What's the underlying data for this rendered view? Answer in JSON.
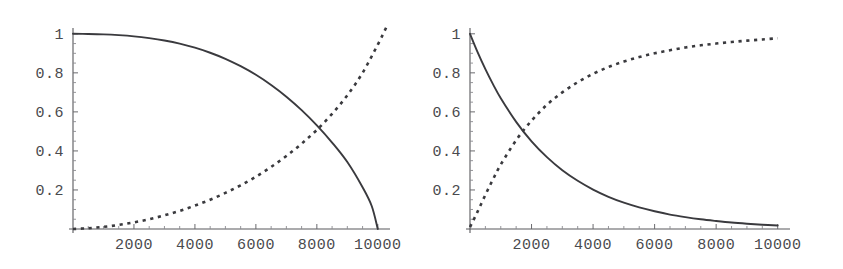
{
  "figure": {
    "background_color": "#ffffff",
    "ink_color": "#3a3a3e",
    "axis_color": "#58585c",
    "panel_count": 2
  },
  "chart_data": [
    {
      "type": "line",
      "title": "",
      "subtitle": "",
      "xlabel": "",
      "ylabel": "",
      "panel": "left",
      "xlim": [
        0,
        10400
      ],
      "ylim": [
        0,
        1.04
      ],
      "grid": false,
      "legend": "none",
      "xticks": [
        2000,
        4000,
        6000,
        8000,
        10000
      ],
      "xtick_labels": [
        "2000",
        "4000",
        "6000",
        "8000",
        "10000"
      ],
      "yticks": [
        0.2,
        0.4,
        0.6,
        0.8,
        1
      ],
      "ytick_labels": [
        "0.2",
        "0.4",
        "0.6",
        "0.8",
        "1"
      ],
      "annotations": [],
      "series": [
        {
          "name": "solid-decreasing",
          "style": "solid",
          "x": [
            0,
            500,
            1000,
            1500,
            2000,
            2500,
            3000,
            3500,
            4000,
            4500,
            5000,
            5500,
            6000,
            6500,
            7000,
            7500,
            8000,
            8500,
            9000,
            9500,
            9800,
            10000
          ],
          "y": [
            1.0,
            0.999,
            0.997,
            0.993,
            0.987,
            0.978,
            0.966,
            0.95,
            0.929,
            0.903,
            0.872,
            0.834,
            0.79,
            0.738,
            0.678,
            0.609,
            0.531,
            0.443,
            0.343,
            0.214,
            0.118,
            0.0
          ]
        },
        {
          "name": "dashed-increasing",
          "style": "dashed",
          "x": [
            0,
            500,
            1000,
            1500,
            2000,
            2500,
            3000,
            3500,
            4000,
            4500,
            5000,
            5500,
            6000,
            6500,
            7000,
            7500,
            8000,
            8500,
            9000,
            9500,
            10000,
            10300
          ],
          "y": [
            0.0,
            0.004,
            0.011,
            0.021,
            0.034,
            0.05,
            0.07,
            0.093,
            0.12,
            0.15,
            0.185,
            0.224,
            0.268,
            0.318,
            0.374,
            0.437,
            0.508,
            0.59,
            0.685,
            0.8,
            0.945,
            1.04
          ]
        }
      ],
      "crossing_point": {
        "x": 8400,
        "y": 0.51
      }
    },
    {
      "type": "line",
      "title": "",
      "subtitle": "",
      "xlabel": "",
      "ylabel": "",
      "panel": "right",
      "xlim": [
        0,
        10400
      ],
      "ylim": [
        0,
        1.04
      ],
      "grid": false,
      "legend": "none",
      "xticks": [
        2000,
        4000,
        6000,
        8000,
        10000
      ],
      "xtick_labels": [
        "2000",
        "4000",
        "6000",
        "8000",
        "10000"
      ],
      "yticks": [
        0.2,
        0.4,
        0.6,
        0.8,
        1
      ],
      "ytick_labels": [
        "0.2",
        "0.4",
        "0.6",
        "0.8",
        "1"
      ],
      "annotations": [],
      "series": [
        {
          "name": "solid-decreasing",
          "style": "solid",
          "x": [
            0,
            250,
            500,
            750,
            1000,
            1500,
            2000,
            2500,
            3000,
            3500,
            4000,
            4500,
            5000,
            5500,
            6000,
            6500,
            7000,
            7500,
            8000,
            8500,
            9000,
            9500,
            10000
          ],
          "y": [
            1.0,
            0.905,
            0.819,
            0.741,
            0.67,
            0.549,
            0.449,
            0.368,
            0.301,
            0.247,
            0.202,
            0.165,
            0.135,
            0.111,
            0.091,
            0.074,
            0.061,
            0.05,
            0.041,
            0.033,
            0.027,
            0.022,
            0.018
          ]
        },
        {
          "name": "dashed-increasing",
          "style": "dashed",
          "x": [
            0,
            250,
            500,
            750,
            1000,
            1500,
            2000,
            2500,
            3000,
            3500,
            4000,
            4500,
            5000,
            5500,
            6000,
            6500,
            7000,
            7500,
            8000,
            8500,
            9000,
            9500,
            10000
          ],
          "y": [
            0.01,
            0.09,
            0.175,
            0.255,
            0.33,
            0.455,
            0.555,
            0.636,
            0.7,
            0.752,
            0.795,
            0.83,
            0.858,
            0.881,
            0.9,
            0.916,
            0.93,
            0.941,
            0.95,
            0.958,
            0.965,
            0.971,
            0.977
          ]
        }
      ],
      "crossing_point": {
        "x": 1700,
        "y": 0.51
      }
    }
  ]
}
